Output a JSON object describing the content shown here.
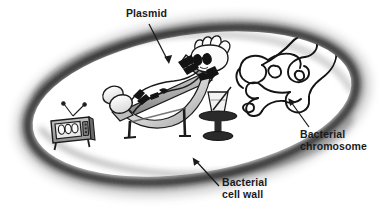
{
  "diagram": {
    "background_color": "#ffffff",
    "labels": {
      "plasmid": "Plasmid",
      "chromosome_line1": "Bacterial",
      "chromosome_line2": "chromosome",
      "cellwall_line1": "Bacterial",
      "cellwall_line2": "cell wall"
    },
    "colors": {
      "ink": "#1a1a1a",
      "wall_dark": "#2b2b2b",
      "wall_mid": "#6e6e6e",
      "interior": "#ffffff",
      "chair_gray": "#9a9a9a",
      "chair_light": "#d6d6d6",
      "tv_gray": "#b4b4b4",
      "shadow": "#bdbdbd"
    },
    "elements": {
      "cell_wall": "ellipse-cell-wall",
      "plasmid_character": "plasmid-cartoon-character",
      "deck_chair": "deck-chair",
      "television": "retro-television",
      "drink_table": "side-table-with-cocktail",
      "chromosome": "tangled-dna-loop"
    },
    "annotations": [
      {
        "name": "plasmid",
        "from": [
          150,
          25
        ],
        "to": [
          169,
          63
        ]
      },
      {
        "name": "chromosome",
        "from": [
          307,
          128
        ],
        "to": [
          288,
          99
        ]
      },
      {
        "name": "cellwall",
        "from": [
          218,
          186
        ],
        "to": [
          192,
          157
        ]
      }
    ]
  }
}
